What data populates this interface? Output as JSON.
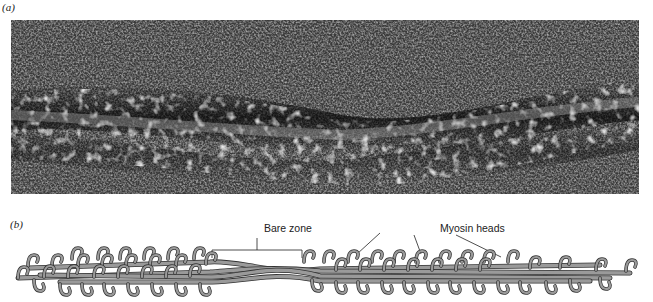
{
  "figure": {
    "panel_a": {
      "label": "(a)",
      "description": "Electron micrograph of a thick filament"
    },
    "panel_b": {
      "label": "(b)",
      "description": "Schematic of thick filament with myosin heads",
      "annotations": {
        "bare_zone": "Bare zone",
        "myosin_heads": "Myosin heads"
      }
    },
    "colors": {
      "micrograph_bg": "#2a2a2a",
      "filament_fill": "#9a9a9a",
      "filament_stroke": "#333333",
      "label_text": "#222222"
    }
  }
}
